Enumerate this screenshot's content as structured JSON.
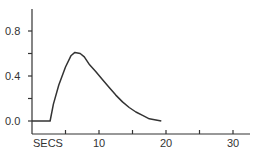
{
  "chart_data": {
    "type": "line",
    "title": "",
    "xlabel": "SECS",
    "ylabel": "",
    "xlim": [
      0,
      32
    ],
    "ylim": [
      -0.12,
      0.98
    ],
    "x_ticks": [
      5,
      10,
      15,
      20,
      25,
      30
    ],
    "x_tick_labels": [
      "",
      "10",
      "",
      "20",
      "",
      "30"
    ],
    "y_ticks": [
      0.0,
      0.2,
      0.4,
      0.6,
      0.8
    ],
    "y_tick_labels": [
      "0.0",
      "",
      "0.4",
      "",
      "0.8"
    ],
    "grid": false,
    "series": [
      {
        "name": "response",
        "x": [
          0,
          1,
          2,
          2.7,
          3.2,
          4.0,
          5.0,
          5.8,
          6.4,
          7.2,
          7.8,
          8.6,
          9.5,
          10.5,
          11.5,
          12.5,
          13.5,
          14.5,
          15.5,
          16.5,
          17.5,
          18.5,
          19.3
        ],
        "values": [
          0.0,
          0.0,
          0.0,
          0.0,
          0.15,
          0.32,
          0.48,
          0.58,
          0.61,
          0.6,
          0.57,
          0.5,
          0.44,
          0.37,
          0.3,
          0.23,
          0.17,
          0.12,
          0.08,
          0.05,
          0.02,
          0.01,
          0.0
        ]
      }
    ]
  },
  "axis": {
    "x_label": "SECS",
    "y_labels": [
      "0.0",
      "0.4",
      "0.8"
    ],
    "x_labels": [
      "10",
      "20",
      "30"
    ]
  },
  "colors": {
    "line": "#333333",
    "axis": "#333333",
    "text": "#333333"
  }
}
